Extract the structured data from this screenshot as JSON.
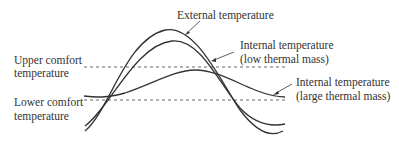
{
  "diagram": {
    "labels": {
      "external": "External temperature",
      "internal_low_line1": "Internal temperature",
      "internal_low_line2": "(low thermal mass)",
      "internal_large_line1": "Internal temperature",
      "internal_large_line2": "(large thermal mass)",
      "upper_line1": "Upper comfort",
      "upper_line2": "temperature",
      "lower_line1": "Lower comfort",
      "lower_line2": "temperature"
    },
    "colors": {
      "curve": "#333333",
      "dashed": "#555555",
      "text": "#333333"
    }
  }
}
